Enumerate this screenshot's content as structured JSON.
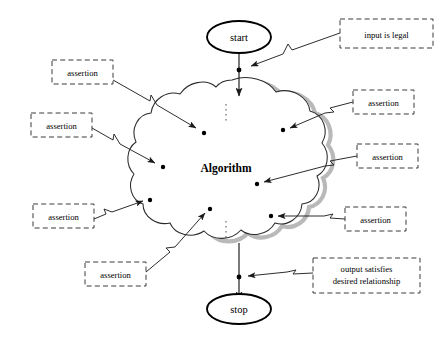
{
  "diagram": {
    "colors": {
      "ink": "#1a1a1a",
      "box_stroke": "#3a3a3a",
      "cloud_stroke": "#2b2b2b",
      "cloud_shadow": "#b9b9b9",
      "background": "#ffffff"
    },
    "nodes": {
      "start": {
        "label": "start",
        "shape": "ellipse",
        "cx": 239,
        "cy": 37,
        "rx": 32,
        "ry": 16
      },
      "stop": {
        "label": "stop",
        "shape": "ellipse",
        "cx": 239,
        "cy": 309,
        "rx": 32,
        "ry": 15
      },
      "algorithm": {
        "label": "Algorithm",
        "shape": "cloud",
        "cx": 226,
        "cy": 168
      }
    },
    "annotations": [
      {
        "id": "input-legal",
        "label": "input is legal",
        "lines": [
          "input is legal"
        ],
        "x": 340,
        "y": 19,
        "w": 93,
        "h": 29,
        "anchor": {
          "x": 240,
          "y": 70
        }
      },
      {
        "id": "assertion-top-left",
        "label": "assertion",
        "lines": [
          "assertion"
        ],
        "x": 52,
        "y": 60,
        "w": 61,
        "h": 24,
        "anchor": {
          "x": 204,
          "y": 133
        }
      },
      {
        "id": "assertion-mid-left",
        "label": "assertion",
        "lines": [
          "assertion"
        ],
        "x": 31,
        "y": 113,
        "w": 61,
        "h": 24,
        "anchor": {
          "x": 163,
          "y": 167
        }
      },
      {
        "id": "assertion-low-left",
        "label": "assertion",
        "lines": [
          "assertion"
        ],
        "x": 33,
        "y": 204,
        "w": 61,
        "h": 24,
        "anchor": {
          "x": 150,
          "y": 200
        }
      },
      {
        "id": "assertion-bottom-left",
        "label": "assertion",
        "lines": [
          "assertion"
        ],
        "x": 85,
        "y": 262,
        "w": 61,
        "h": 24,
        "anchor": {
          "x": 210,
          "y": 209
        }
      },
      {
        "id": "assertion-top-right",
        "label": "assertion",
        "lines": [
          "assertion"
        ],
        "x": 353,
        "y": 90,
        "w": 61,
        "h": 24,
        "anchor": {
          "x": 283,
          "y": 130
        }
      },
      {
        "id": "assertion-mid-right",
        "label": "assertion",
        "lines": [
          "assertion"
        ],
        "x": 357,
        "y": 144,
        "w": 61,
        "h": 24,
        "anchor": {
          "x": 257,
          "y": 184
        }
      },
      {
        "id": "assertion-low-right",
        "label": "assertion",
        "lines": [
          "assertion"
        ],
        "x": 345,
        "y": 207,
        "w": 61,
        "h": 24,
        "anchor": {
          "x": 271,
          "y": 216
        }
      },
      {
        "id": "output-satisfies",
        "label": "output satisfies desired relationship",
        "lines": [
          "output satisfies",
          "desired relationship"
        ],
        "x": 313,
        "y": 258,
        "w": 107,
        "h": 35,
        "anchor": {
          "x": 240,
          "y": 277
        }
      }
    ],
    "junction_dots": [
      {
        "id": "entry-dot",
        "x": 239,
        "y": 70
      },
      {
        "id": "exit-dot",
        "x": 239,
        "y": 277
      }
    ],
    "inner_dots": [
      {
        "id": "dot-a",
        "x": 204,
        "y": 133
      },
      {
        "id": "dot-b",
        "x": 163,
        "y": 167
      },
      {
        "id": "dot-c",
        "x": 150,
        "y": 200
      },
      {
        "id": "dot-d",
        "x": 210,
        "y": 209
      },
      {
        "id": "dot-e",
        "x": 283,
        "y": 130
      },
      {
        "id": "dot-f",
        "x": 257,
        "y": 184
      },
      {
        "id": "dot-g",
        "x": 271,
        "y": 216
      }
    ],
    "flow_edges": [
      {
        "id": "start-to-cloud",
        "from": "start",
        "to": "algorithm",
        "x": 239,
        "y1": 53,
        "y2": 96
      },
      {
        "id": "cloud-to-stop",
        "from": "algorithm",
        "to": "stop",
        "x": 239,
        "y1": 243,
        "y2": 294
      }
    ],
    "dotted_marks": [
      {
        "id": "dotted-top",
        "x": 226,
        "y1": 104,
        "y2": 122
      },
      {
        "id": "dotted-bottom",
        "x": 226,
        "y1": 221,
        "y2": 238
      }
    ]
  }
}
